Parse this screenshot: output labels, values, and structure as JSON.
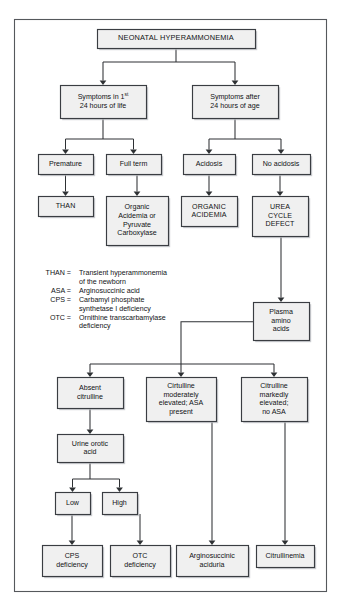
{
  "figure": {
    "name": "neonatal-hyperammonemia-diagnostic-algorithm",
    "frame_color": "#55585c",
    "node_fill": "#f0f0f0",
    "node_stroke": "#3a3d42",
    "edge_color": "#2e3134",
    "background": "#ffffff"
  },
  "nodes": {
    "root": {
      "lines": [
        "NEONATAL HYPERAMMONEMIA"
      ],
      "style": "title"
    },
    "sym_early": {
      "lines": [
        "Symptoms in 1|st| ",
        "24 hours of life"
      ],
      "style": "normal"
    },
    "sym_late": {
      "lines": [
        "Symptoms after",
        "24 hours of age"
      ],
      "style": "normal"
    },
    "premature": {
      "lines": [
        "Premature"
      ],
      "style": "normal"
    },
    "full_term": {
      "lines": [
        "Full term"
      ],
      "style": "normal"
    },
    "acidosis": {
      "lines": [
        "Acidosis"
      ],
      "style": "normal"
    },
    "no_acidosis": {
      "lines": [
        "No acidosis"
      ],
      "style": "normal"
    },
    "than": {
      "lines": [
        "THAN"
      ],
      "style": "caps"
    },
    "organic_or_pyruvate": {
      "lines": [
        "Organic",
        "Acidemia or",
        "Pyruvate",
        "Carboxylase"
      ],
      "style": "normal"
    },
    "organic_acidemia": {
      "lines": [
        "ORGANIC",
        "ACIDEMIA"
      ],
      "style": "caps"
    },
    "urea_cycle_defect": {
      "lines": [
        "UREA",
        "CYCLE",
        "DEFECT"
      ],
      "style": "caps"
    },
    "plasma_amino_acids": {
      "lines": [
        "Plasma",
        "amino",
        "acids"
      ],
      "style": "normal"
    },
    "absent_citrulline": {
      "lines": [
        "Absent",
        "citrulline"
      ],
      "style": "normal"
    },
    "citrulline_moderate": {
      "lines": [
        "Cirtulline",
        "moderately",
        "elevated; ASA",
        "present"
      ],
      "style": "normal"
    },
    "citrulline_marked": {
      "lines": [
        "Citrulline",
        "markedly",
        "elevated;",
        "no ASA"
      ],
      "style": "normal"
    },
    "urine_orotic_acid": {
      "lines": [
        "Urine orotic",
        "acid"
      ],
      "style": "normal"
    },
    "low": {
      "lines": [
        "Low"
      ],
      "style": "normal"
    },
    "high": {
      "lines": [
        "High"
      ],
      "style": "normal"
    },
    "cps_deficiency": {
      "lines": [
        "CPS",
        "deficiency"
      ],
      "style": "normal"
    },
    "otc_deficiency": {
      "lines": [
        "OTC",
        "deficiency"
      ],
      "style": "normal"
    },
    "argininosuccinic_aciduria": {
      "lines": [
        "Arginosuccinic",
        "aciduria"
      ],
      "style": "normal"
    },
    "citrullinemia": {
      "lines": [
        "Citrullinemia"
      ],
      "style": "normal"
    }
  },
  "legend": {
    "entries": [
      {
        "key": "THAN",
        "value": [
          "Transient hyperammonemia",
          "of the newborn"
        ]
      },
      {
        "key": "ASA",
        "value": [
          "Arginosuccinic acid"
        ]
      },
      {
        "key": "CPS",
        "value": [
          "Carbamyl phosphate",
          "synthetase I deficiency"
        ]
      },
      {
        "key": "OTC",
        "value": [
          "Ornithine transcarbamylase",
          "deficiency"
        ]
      }
    ],
    "separator": "="
  }
}
